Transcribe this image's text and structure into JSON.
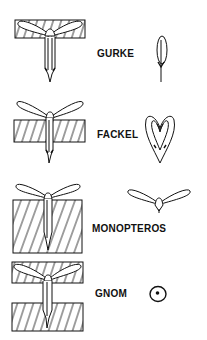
{
  "figure": {
    "type": "diagram",
    "panels": [
      {
        "id": "gurke",
        "label": "GURKE"
      },
      {
        "id": "fackel",
        "label": "FACKEL"
      },
      {
        "id": "monopteros",
        "label": "MONOPTEROS"
      },
      {
        "id": "gnom",
        "label": "GNOM"
      }
    ],
    "colors": {
      "ink": "#111111",
      "background": "#ffffff"
    }
  }
}
